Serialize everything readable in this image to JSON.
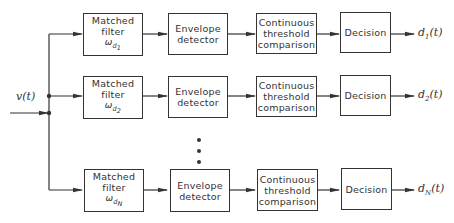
{
  "diagram": {
    "type": "block-diagram",
    "input": {
      "label": "v(t)"
    },
    "ellipsis": "⋮",
    "blocks": {
      "matched_filter": {
        "line1": "Matched",
        "line2": "filter",
        "symbol": "ω"
      },
      "envelope_detector": {
        "line1": "Envelope",
        "line2": "detector"
      },
      "threshold": {
        "line1": "Continuous",
        "line2": "threshold",
        "line3": "comparison"
      },
      "decision": {
        "label": "Decision"
      }
    },
    "channels": [
      {
        "filter_sub": "d",
        "filter_subsub": "1",
        "output_var": "d",
        "output_sub": "1",
        "output_arg": "(t)"
      },
      {
        "filter_sub": "d",
        "filter_subsub": "2",
        "output_var": "d",
        "output_sub": "2",
        "output_arg": "(t)"
      },
      {
        "filter_sub": "d",
        "filter_subsub": "N",
        "output_var": "d",
        "output_sub": "N",
        "output_arg": "(t)"
      }
    ],
    "colors": {
      "line": "#333333",
      "background": "#ffffff"
    }
  }
}
